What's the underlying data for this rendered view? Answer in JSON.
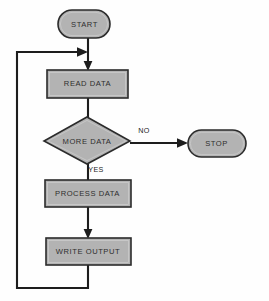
{
  "diagram": {
    "type": "flowchart",
    "background_color": "#fefefe",
    "shape_fill_color": "#b3b3b3",
    "shape_border_color": "#2b2b2b",
    "connector_color": "#1d1d1d",
    "text_color": "#2e2e2e"
  },
  "nodes": {
    "start": {
      "label": "START",
      "shape": "terminator",
      "x": 58,
      "y": 10,
      "width": 52,
      "height": 28
    },
    "read_data": {
      "label": "READ DATA",
      "shape": "process",
      "x": 47,
      "y": 70,
      "width": 81,
      "height": 28
    },
    "more_data": {
      "label": "MORE DATA",
      "shape": "decision",
      "cx": 87,
      "cy": 141,
      "rx": 43,
      "ry": 24
    },
    "stop": {
      "label": "STOP",
      "shape": "terminator",
      "x": 188,
      "y": 130,
      "width": 58,
      "height": 27
    },
    "process_data": {
      "label": "PROCESS DATA",
      "shape": "process",
      "x": 45,
      "y": 180,
      "width": 86,
      "height": 27
    },
    "write_output": {
      "label": "WRITE OUTPUT",
      "shape": "process",
      "x": 46,
      "y": 238,
      "width": 85,
      "height": 27
    }
  },
  "edge_labels": {
    "no": "NO",
    "yes": "YES"
  },
  "edges": [
    {
      "from": "start",
      "to": "read_data",
      "label": ""
    },
    {
      "from": "read_data",
      "to": "more_data",
      "label": ""
    },
    {
      "from": "more_data",
      "to": "stop",
      "label": "NO"
    },
    {
      "from": "more_data",
      "to": "process_data",
      "label": "YES"
    },
    {
      "from": "process_data",
      "to": "write_output",
      "label": ""
    },
    {
      "from": "write_output",
      "to": "read_data",
      "label": ""
    }
  ]
}
